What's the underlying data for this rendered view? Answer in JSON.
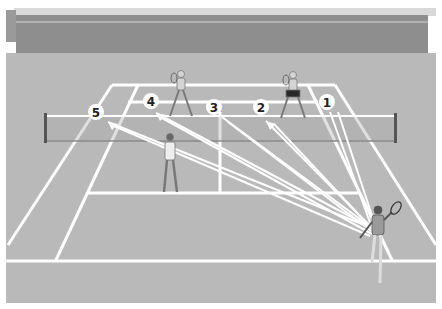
{
  "diagram": {
    "colors": {
      "background": "#ffffff",
      "stands": "#8f8f8f",
      "stands_top": "#cfcfcf",
      "court": "#b8b8b8",
      "court_lines": "#ffffff",
      "player_skin": "#d8d8d8",
      "arrow": "#ffffff",
      "marker_fill": "#ffffff",
      "marker_text": "#222222"
    },
    "targets": [
      {
        "id": 1,
        "label": "1",
        "x": 327,
        "y": 102
      },
      {
        "id": 2,
        "label": "2",
        "x": 261,
        "y": 107
      },
      {
        "id": 3,
        "label": "3",
        "x": 214,
        "y": 107
      },
      {
        "id": 4,
        "label": "4",
        "x": 151,
        "y": 101
      },
      {
        "id": 5,
        "label": "5",
        "x": 96,
        "y": 112
      }
    ],
    "hitter": {
      "x": 376,
      "y": 240,
      "label": "baseline hitter"
    },
    "players": [
      {
        "name": "opponent-left",
        "x": 181,
        "y": 92
      },
      {
        "name": "opponent-right",
        "x": 293,
        "y": 92
      },
      {
        "name": "partner-at-net",
        "x": 170,
        "y": 165
      }
    ]
  }
}
